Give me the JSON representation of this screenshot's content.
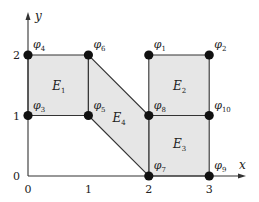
{
  "diagram": {
    "title": "",
    "colors": {
      "element_fill": "#e6e6e6",
      "edge": "#333333",
      "node": "#111111",
      "background": "#ffffff"
    },
    "axes": {
      "x_label": "x",
      "y_label": "y",
      "x_ticks": [
        "0",
        "1",
        "2",
        "3"
      ],
      "y_ticks": [
        "0",
        "1",
        "2"
      ],
      "x_range": [
        0,
        3
      ],
      "y_range": [
        0,
        2
      ]
    },
    "nodes": [
      {
        "id": "phi1",
        "symbol": "φ",
        "sub": "1",
        "x": 2,
        "y": 2
      },
      {
        "id": "phi2",
        "symbol": "φ",
        "sub": "2",
        "x": 3,
        "y": 2
      },
      {
        "id": "phi3",
        "symbol": "φ",
        "sub": "3",
        "x": 0,
        "y": 1
      },
      {
        "id": "phi4",
        "symbol": "φ",
        "sub": "4",
        "x": 0,
        "y": 2
      },
      {
        "id": "phi5",
        "symbol": "φ",
        "sub": "5",
        "x": 1,
        "y": 1
      },
      {
        "id": "phi6",
        "symbol": "φ",
        "sub": "6",
        "x": 1,
        "y": 2
      },
      {
        "id": "phi7",
        "symbol": "φ",
        "sub": "7",
        "x": 2,
        "y": 0
      },
      {
        "id": "phi8",
        "symbol": "φ",
        "sub": "8",
        "x": 2,
        "y": 1
      },
      {
        "id": "phi9",
        "symbol": "φ",
        "sub": "9",
        "x": 3,
        "y": 0
      },
      {
        "id": "phi10",
        "symbol": "φ",
        "sub": "10",
        "x": 3,
        "y": 1
      }
    ],
    "elements": [
      {
        "id": "E1",
        "symbol": "E",
        "sub": "1",
        "vertices": [
          [
            0,
            1
          ],
          [
            1,
            1
          ],
          [
            1,
            2
          ],
          [
            0,
            2
          ]
        ],
        "label_at": [
          0.5,
          1.5
        ]
      },
      {
        "id": "E2",
        "symbol": "E",
        "sub": "2",
        "vertices": [
          [
            2,
            1
          ],
          [
            3,
            1
          ],
          [
            3,
            2
          ],
          [
            2,
            2
          ]
        ],
        "label_at": [
          2.5,
          1.5
        ]
      },
      {
        "id": "E3",
        "symbol": "E",
        "sub": "3",
        "vertices": [
          [
            2,
            0
          ],
          [
            3,
            0
          ],
          [
            3,
            1
          ],
          [
            2,
            1
          ]
        ],
        "label_at": [
          2.5,
          0.55
        ]
      },
      {
        "id": "E4",
        "symbol": "E",
        "sub": "4",
        "vertices": [
          [
            1,
            1
          ],
          [
            2,
            0
          ],
          [
            2,
            1
          ],
          [
            1,
            2
          ]
        ],
        "label_at": [
          1.5,
          0.97
        ]
      }
    ]
  }
}
